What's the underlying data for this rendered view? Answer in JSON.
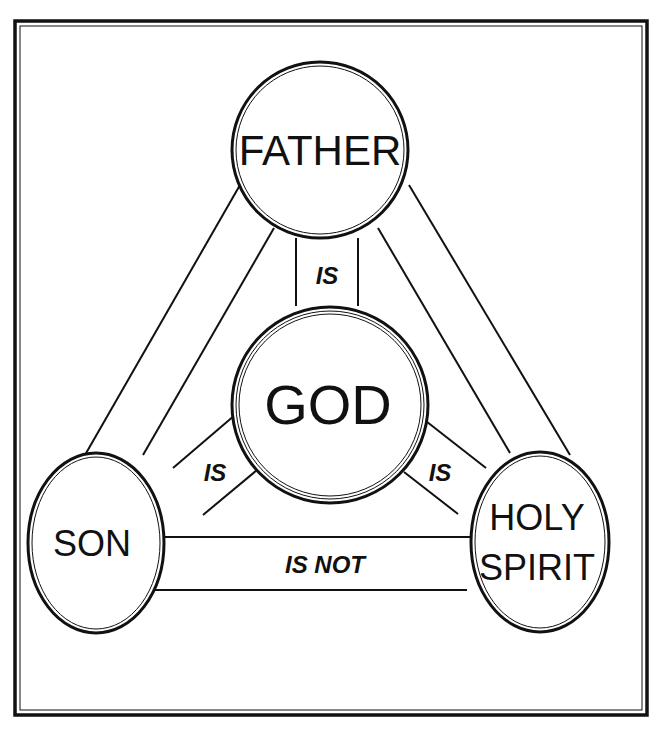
{
  "diagram": {
    "nodes": {
      "father": {
        "label": "FATHER"
      },
      "god": {
        "label": "GOD"
      },
      "son": {
        "label": "SON"
      },
      "spirit": {
        "label_line1": "HOLY",
        "label_line2": "SPIRIT"
      }
    },
    "edges": {
      "father_god": {
        "label": "IS"
      },
      "son_god": {
        "label": "IS"
      },
      "spirit_god": {
        "label": "IS"
      },
      "son_spirit": {
        "label": "IS NOT"
      }
    },
    "colors": {
      "ink": "#111111",
      "background": "#ffffff"
    }
  }
}
